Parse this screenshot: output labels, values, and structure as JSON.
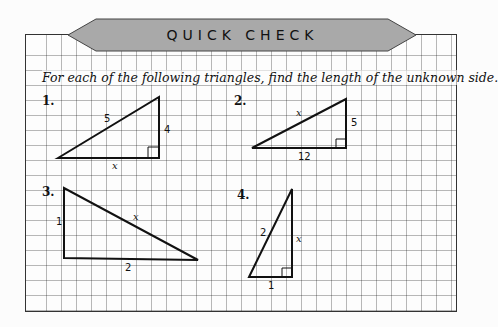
{
  "banner": {
    "title": "QUICK CHECK",
    "fill": "#a8a8a8"
  },
  "instruction": "For each of the following triangles, find the length of the unknown side.",
  "problems": [
    {
      "number": "1.",
      "hypotenuse": "5",
      "leg_vertical": "4",
      "leg_horizontal": "x",
      "right_angle": "bottom-right"
    },
    {
      "number": "2.",
      "hypotenuse": "x",
      "leg_vertical": "5",
      "leg_horizontal": "12",
      "right_angle": "bottom-right"
    },
    {
      "number": "3.",
      "hypotenuse": "x",
      "leg_vertical": "1",
      "leg_horizontal": "2",
      "right_angle": "bottom-left"
    },
    {
      "number": "4.",
      "hypotenuse": "2",
      "leg_vertical": "x",
      "leg_horizontal": "1",
      "right_angle": "bottom-right"
    }
  ]
}
